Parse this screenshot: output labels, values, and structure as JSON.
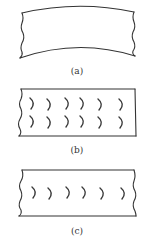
{
  "figure": {
    "panels": [
      {
        "id": "a",
        "label": "(a)",
        "description": "Strip bent into an upward arch, no marks"
      },
      {
        "id": "b",
        "label": "(b)",
        "description": "Flat strip with two rows of six crescent marks",
        "rows": 2,
        "marks_per_row": 6
      },
      {
        "id": "c",
        "label": "(c)",
        "description": "Flat strip with one row of six crescent marks",
        "rows": 1,
        "marks_per_row": 6
      }
    ],
    "colors": {
      "line": "#333333",
      "background": "#ffffff"
    }
  }
}
